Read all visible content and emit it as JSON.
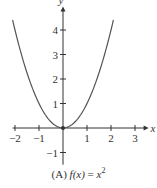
{
  "chart_data": {
    "type": "line",
    "function": "x^2",
    "xlabel": "x",
    "ylabel": "y",
    "xlim": [
      -2.1,
      3.4
    ],
    "ylim": [
      -1.5,
      4.8
    ],
    "x_ticks": [
      -2,
      -1,
      1,
      2,
      3
    ],
    "y_ticks": [
      -1,
      1,
      2,
      3,
      4
    ],
    "x": [
      -2.1,
      -1.5,
      -1,
      -0.5,
      0,
      0.5,
      1,
      1.5,
      2.1
    ],
    "values": [
      4.41,
      2.25,
      1,
      0.25,
      0,
      0.25,
      1,
      2.25,
      4.41
    ],
    "grid": false,
    "legend": null
  },
  "caption": {
    "prefix": "(A) ",
    "func": "f(x)",
    "eq": " = ",
    "var": "x",
    "exp": "2"
  },
  "colors": {
    "axis": "#333333",
    "curve": "#555555"
  }
}
